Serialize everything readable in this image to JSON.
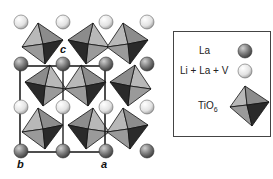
{
  "diagram": {
    "type": "crystal-structure",
    "axis_labels": {
      "c": "c",
      "b": "b",
      "a": "a"
    },
    "colors": {
      "la_sphere": "#6e6e6e",
      "li_la_v_sphere": "#e6e6e6",
      "face_light": "#b8b8b8",
      "face_mid": "#8c8c8c",
      "face_midlight": "#a0a0a0",
      "face_dark": "#2a2a2a",
      "unit_cell_line": "#222222"
    }
  },
  "legend": {
    "items": [
      {
        "label": "La",
        "symbol": "dark-sphere"
      },
      {
        "label": "Li + La + V",
        "symbol": "light-sphere"
      },
      {
        "label": "TiO",
        "subscript": "6",
        "symbol": "octahedron"
      }
    ]
  }
}
